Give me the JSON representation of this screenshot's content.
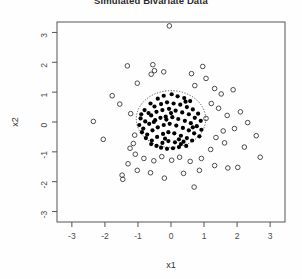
{
  "chart_data": {
    "type": "scatter",
    "title": "Simulated Bivariate Data",
    "xlabel": "x1",
    "ylabel": "x2",
    "xlim": [
      -3.45,
      3.45
    ],
    "ylim": [
      -3.35,
      3.35
    ],
    "xticks": [
      -3,
      -2,
      -1,
      0,
      1,
      2,
      3
    ],
    "yticks": [
      -3,
      -2,
      -1,
      0,
      1,
      2,
      3
    ],
    "xtick_labels": [
      "-3",
      "-2",
      "-1",
      "0",
      "1",
      "2",
      "3"
    ],
    "ytick_labels": [
      "-3",
      "-2",
      "-1",
      "0",
      "1",
      "2",
      "3"
    ],
    "grid": false,
    "legend": "none",
    "annotations": [
      {
        "kind": "ellipse",
        "name": "tolerance-ellipse",
        "center": [
          0.0,
          0.1
        ],
        "rx": 1.05,
        "ry": 0.95,
        "linestyle": "dotted",
        "color": "#555555"
      }
    ],
    "series": [
      {
        "name": "inside-ellipse",
        "marker": "filled-circle",
        "color": "#000000",
        "points": [
          [
            -0.62,
            0.62
          ],
          [
            -0.4,
            0.78
          ],
          [
            -0.22,
            0.88
          ],
          [
            0.02,
            0.93
          ],
          [
            0.2,
            0.86
          ],
          [
            0.4,
            0.8
          ],
          [
            0.58,
            0.7
          ],
          [
            -0.8,
            0.4
          ],
          [
            -0.68,
            0.3
          ],
          [
            -0.5,
            0.52
          ],
          [
            -0.3,
            0.6
          ],
          [
            -0.12,
            0.66
          ],
          [
            0.08,
            0.62
          ],
          [
            0.28,
            0.58
          ],
          [
            0.48,
            0.5
          ],
          [
            0.66,
            0.42
          ],
          [
            0.82,
            0.28
          ],
          [
            -0.92,
            0.12
          ],
          [
            -0.78,
            0.02
          ],
          [
            -0.6,
            0.22
          ],
          [
            -0.44,
            0.34
          ],
          [
            -0.26,
            0.4
          ],
          [
            -0.06,
            0.44
          ],
          [
            0.14,
            0.38
          ],
          [
            0.34,
            0.32
          ],
          [
            0.54,
            0.26
          ],
          [
            0.72,
            0.14
          ],
          [
            0.9,
            0.04
          ],
          [
            -0.96,
            -0.1
          ],
          [
            -0.84,
            -0.22
          ],
          [
            -0.66,
            -0.06
          ],
          [
            -0.48,
            0.06
          ],
          [
            -0.32,
            0.14
          ],
          [
            -0.16,
            0.18
          ],
          [
            0.04,
            0.16
          ],
          [
            0.22,
            0.1
          ],
          [
            0.42,
            0.04
          ],
          [
            0.6,
            -0.04
          ],
          [
            0.78,
            -0.14
          ],
          [
            0.92,
            -0.26
          ],
          [
            -0.88,
            -0.34
          ],
          [
            -0.72,
            -0.42
          ],
          [
            -0.56,
            -0.28
          ],
          [
            -0.4,
            -0.18
          ],
          [
            -0.22,
            -0.1
          ],
          [
            -0.04,
            -0.06
          ],
          [
            0.16,
            -0.12
          ],
          [
            0.36,
            -0.2
          ],
          [
            0.54,
            -0.28
          ],
          [
            0.7,
            -0.38
          ],
          [
            0.86,
            -0.48
          ],
          [
            -0.76,
            -0.54
          ],
          [
            -0.58,
            -0.62
          ],
          [
            -0.42,
            -0.5
          ],
          [
            -0.24,
            -0.4
          ],
          [
            -0.08,
            -0.34
          ],
          [
            0.1,
            -0.38
          ],
          [
            0.3,
            -0.46
          ],
          [
            0.48,
            -0.54
          ],
          [
            0.64,
            -0.62
          ],
          [
            -0.6,
            -0.74
          ],
          [
            -0.44,
            -0.8
          ],
          [
            -0.26,
            -0.7
          ],
          [
            -0.08,
            -0.64
          ],
          [
            0.12,
            -0.68
          ],
          [
            0.3,
            -0.74
          ],
          [
            0.46,
            -0.8
          ],
          [
            -0.3,
            -0.86
          ],
          [
            -0.12,
            -0.9
          ],
          [
            0.06,
            -0.88
          ],
          [
            0.24,
            -0.84
          ],
          [
            -0.52,
            0.0
          ],
          [
            0.0,
            0.3
          ],
          [
            -0.18,
            -0.56
          ],
          [
            0.24,
            -0.58
          ],
          [
            0.66,
            -0.18
          ],
          [
            -0.9,
            0.26
          ],
          [
            0.44,
            0.68
          ],
          [
            -0.14,
            0.08
          ],
          [
            0.38,
            -0.66
          ]
        ]
      },
      {
        "name": "outside-ellipse",
        "marker": "open-circle",
        "color": "#3a3a3a",
        "points": [
          [
            -0.05,
            3.22
          ],
          [
            -0.55,
            1.92
          ],
          [
            -0.5,
            1.72
          ],
          [
            -0.6,
            1.6
          ],
          [
            -0.22,
            1.68
          ],
          [
            -1.55,
            0.6
          ],
          [
            -2.35,
            0.02
          ],
          [
            -2.05,
            -0.58
          ],
          [
            -1.22,
            0.28
          ],
          [
            -1.02,
            1.3
          ],
          [
            0.62,
            1.62
          ],
          [
            0.72,
            1.22
          ],
          [
            1.06,
            1.46
          ],
          [
            1.32,
            1.12
          ],
          [
            1.52,
            0.94
          ],
          [
            1.22,
            0.62
          ],
          [
            1.44,
            0.46
          ],
          [
            1.7,
            0.22
          ],
          [
            2.1,
            0.34
          ],
          [
            2.32,
            -0.02
          ],
          [
            1.92,
            -0.22
          ],
          [
            1.58,
            -0.3
          ],
          [
            1.36,
            -0.52
          ],
          [
            1.62,
            -0.7
          ],
          [
            1.2,
            -0.92
          ],
          [
            2.22,
            -0.84
          ],
          [
            2.58,
            -0.46
          ],
          [
            2.7,
            -1.18
          ],
          [
            0.92,
            -1.22
          ],
          [
            0.58,
            -1.32
          ],
          [
            0.26,
            -1.18
          ],
          [
            0.02,
            -1.28
          ],
          [
            -0.28,
            -1.16
          ],
          [
            -0.52,
            -1.3
          ],
          [
            -0.82,
            -1.22
          ],
          [
            -1.08,
            -1.08
          ],
          [
            -1.3,
            -1.4
          ],
          [
            -1.02,
            -1.62
          ],
          [
            -1.48,
            -1.78
          ],
          [
            -1.46,
            -1.92
          ],
          [
            -0.62,
            -1.7
          ],
          [
            -0.2,
            -1.88
          ],
          [
            0.38,
            -1.72
          ],
          [
            0.86,
            -1.62
          ],
          [
            1.32,
            -1.46
          ],
          [
            1.72,
            -1.54
          ],
          [
            0.7,
            -2.18
          ],
          [
            -1.78,
            0.88
          ],
          [
            -1.1,
            -0.44
          ],
          [
            -1.14,
            -0.72
          ],
          [
            -1.24,
            -0.88
          ],
          [
            2.02,
            -1.52
          ],
          [
            1.06,
            0.12
          ],
          [
            -1.32,
            1.88
          ],
          [
            0.96,
            1.86
          ],
          [
            1.88,
            1.08
          ]
        ]
      }
    ]
  }
}
